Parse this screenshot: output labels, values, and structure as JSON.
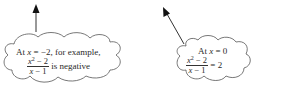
{
  "callouts": [
    {
      "id": "left",
      "line1_prefix": "At ",
      "line1_var": "x",
      "line1_rest": " = −2, for example,",
      "fraction_numerator_var": "x",
      "fraction_numerator_exp": "2",
      "fraction_numerator_rest": " − 2",
      "fraction_denominator_var": "x",
      "fraction_denominator_rest": " − 1",
      "suffix": " is negative",
      "arrow_direction": "up"
    },
    {
      "id": "right",
      "line1_prefix": "At ",
      "line1_var": "x",
      "line1_rest": " = 0",
      "fraction_numerator_var": "x",
      "fraction_numerator_exp": "2",
      "fraction_numerator_rest": " − 2",
      "fraction_denominator_var": "x",
      "fraction_denominator_rest": " − 1",
      "suffix": " = 2",
      "arrow_direction": "up-left"
    }
  ],
  "colors": {
    "stroke": "#333333",
    "background": "#ffffff"
  }
}
